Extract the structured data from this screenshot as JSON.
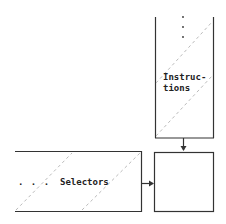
{
  "diagram": {
    "instructions_box": {
      "label_line1": "Instruc-",
      "label_line2": "tions",
      "ellipsis": ":"
    },
    "selectors_box": {
      "label": "Selectors",
      "ellipsis": ". . ."
    },
    "output_box": {
      "label": ""
    },
    "colors": {
      "stroke": "#333333",
      "dash": "#bbbbbb",
      "background": "#ffffff"
    }
  }
}
